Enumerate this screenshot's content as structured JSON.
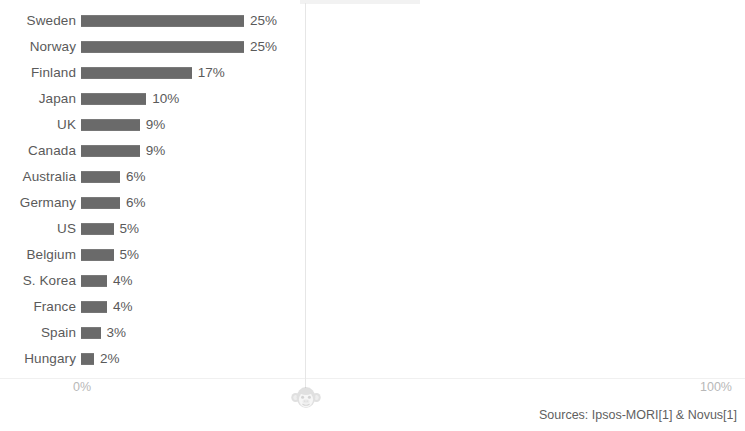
{
  "chart_data": {
    "type": "bar",
    "orientation": "horizontal",
    "title": "",
    "subtitle": "",
    "xlabel": "",
    "ylabel": "",
    "xlim": [
      0,
      100
    ],
    "grid": false,
    "legend": null,
    "value_suffix": "%",
    "categories": [
      "Sweden",
      "Norway",
      "Finland",
      "Japan",
      "UK",
      "Canada",
      "Australia",
      "Germany",
      "US",
      "Belgium",
      "S. Korea",
      "France",
      "Spain",
      "Hungary"
    ],
    "values": [
      25,
      25,
      17,
      10,
      9,
      9,
      6,
      6,
      5,
      5,
      4,
      4,
      3,
      2
    ],
    "value_labels": [
      "25%",
      "25%",
      "17%",
      "10%",
      "9%",
      "9%",
      "6%",
      "6%",
      "5%",
      "5%",
      "4%",
      "4%",
      "3%",
      "2%"
    ],
    "axis_ticks": [
      {
        "value": 0,
        "label": "0%"
      },
      {
        "value": 100,
        "label": "100%"
      }
    ],
    "bar_color": "#6e6e6e",
    "text_color": "#5a5a5a",
    "tick_color": "#b8b8b8",
    "background": "#ffffff"
  },
  "rows": [
    {
      "label": "Sweden",
      "value": 25,
      "value_label": "25%"
    },
    {
      "label": "Norway",
      "value": 25,
      "value_label": "25%"
    },
    {
      "label": "Finland",
      "value": 17,
      "value_label": "17%"
    },
    {
      "label": "Japan",
      "value": 10,
      "value_label": "10%"
    },
    {
      "label": "UK",
      "value": 9,
      "value_label": "9%"
    },
    {
      "label": "Canada",
      "value": 9,
      "value_label": "9%"
    },
    {
      "label": "Australia",
      "value": 6,
      "value_label": "6%"
    },
    {
      "label": "Germany",
      "value": 6,
      "value_label": "6%"
    },
    {
      "label": "US",
      "value": 5,
      "value_label": "5%"
    },
    {
      "label": "Belgium",
      "value": 5,
      "value_label": "5%"
    },
    {
      "label": "S. Korea",
      "value": 4,
      "value_label": "4%"
    },
    {
      "label": "France",
      "value": 4,
      "value_label": "4%"
    },
    {
      "label": "Spain",
      "value": 3,
      "value_label": "3%"
    },
    {
      "label": "Hungary",
      "value": 2,
      "value_label": "2%"
    }
  ],
  "axis": {
    "left_tick": "0%",
    "right_tick": "100%"
  },
  "footer": {
    "sources": "Sources: Ipsos-MORI[1] & Novus[1]"
  },
  "watermark": {
    "icon": "monkey-face-icon"
  }
}
